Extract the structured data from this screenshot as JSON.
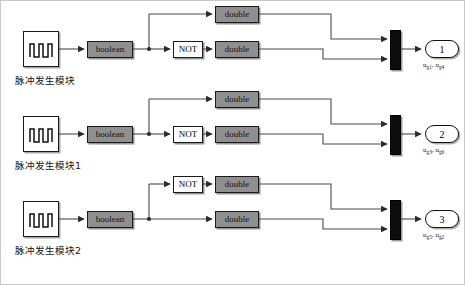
{
  "figure": {
    "background": "#ffffff",
    "border_color": "#c9c9c9",
    "width": 465,
    "height": 285
  },
  "palette": {
    "block_gray_fill": "#8f8f8f",
    "block_white_fill": "#ffffff",
    "block_stroke": "#1a1a1a",
    "mux_fill": "#0d0d0d",
    "wire": "#4a4a4a",
    "text": "#111111"
  },
  "labels": {
    "boolean": "boolean",
    "double": "double",
    "not": "NOT"
  },
  "rows": [
    {
      "id": "row-1",
      "source_caption": "脉冲发生模块",
      "source_icon": "pulse-generator-icon",
      "converter_label": "boolean",
      "not_branch": "bottom",
      "top_branch": {
        "has_not": false,
        "cast_label": "double"
      },
      "bottom_branch": {
        "has_not": true,
        "not_label": "NOT",
        "cast_label": "double"
      },
      "mux_icon": "mux-bar-icon",
      "output": {
        "number": "1",
        "signals": [
          {
            "base": "u",
            "sub": "g1"
          },
          {
            "base": "u",
            "sub": "g4"
          }
        ],
        "caption": "ug1, ug4"
      }
    },
    {
      "id": "row-2",
      "source_caption": "脉冲发生模块1",
      "source_icon": "pulse-generator-icon",
      "converter_label": "boolean",
      "not_branch": "bottom",
      "top_branch": {
        "has_not": false,
        "cast_label": "double"
      },
      "bottom_branch": {
        "has_not": true,
        "not_label": "NOT",
        "cast_label": "double"
      },
      "mux_icon": "mux-bar-icon",
      "output": {
        "number": "2",
        "signals": [
          {
            "base": "u",
            "sub": "g3"
          },
          {
            "base": "u",
            "sub": "g6"
          }
        ],
        "caption": "ug3, ug6"
      }
    },
    {
      "id": "row-3",
      "source_caption": "脉冲发生模块2",
      "source_icon": "pulse-generator-icon",
      "converter_label": "boolean",
      "not_branch": "top",
      "top_branch": {
        "has_not": true,
        "not_label": "NOT",
        "cast_label": "double"
      },
      "bottom_branch": {
        "has_not": false,
        "cast_label": "double"
      },
      "mux_icon": "mux-bar-icon",
      "output": {
        "number": "3",
        "signals": [
          {
            "base": "u",
            "sub": "g5"
          },
          {
            "base": "u",
            "sub": "g2"
          }
        ],
        "caption": "ug5, ug2"
      }
    }
  ]
}
